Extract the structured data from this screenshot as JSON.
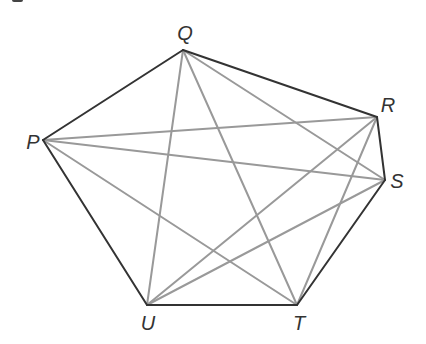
{
  "diagram": {
    "title": "",
    "type": "complete graph on pentagon-like hexagon vertices",
    "colors": {
      "outline": "#333333",
      "diagonal": "#999999",
      "label": "#333333",
      "background": "#ffffff"
    },
    "vertices": [
      {
        "id": "Q",
        "label": "Q",
        "x": 183,
        "y": 50,
        "label_x": 185,
        "label_y": 40
      },
      {
        "id": "R",
        "label": "R",
        "x": 377,
        "y": 117,
        "label_x": 388,
        "label_y": 112
      },
      {
        "id": "S",
        "label": "S",
        "x": 385,
        "y": 180,
        "label_x": 397,
        "label_y": 188
      },
      {
        "id": "T",
        "label": "T",
        "x": 297,
        "y": 305,
        "label_x": 299,
        "label_y": 330
      },
      {
        "id": "U",
        "label": "U",
        "x": 147,
        "y": 305,
        "label_x": 148,
        "label_y": 330
      },
      {
        "id": "P",
        "label": "P",
        "x": 43,
        "y": 140,
        "label_x": 33,
        "label_y": 149
      }
    ],
    "outline_edges": [
      [
        "P",
        "Q"
      ],
      [
        "Q",
        "R"
      ],
      [
        "R",
        "S"
      ],
      [
        "S",
        "T"
      ],
      [
        "T",
        "U"
      ],
      [
        "U",
        "P"
      ]
    ],
    "diagonal_edges": [
      [
        "Q",
        "U"
      ],
      [
        "Q",
        "T"
      ],
      [
        "Q",
        "S"
      ],
      [
        "P",
        "R"
      ],
      [
        "P",
        "S"
      ],
      [
        "P",
        "T"
      ],
      [
        "R",
        "U"
      ],
      [
        "R",
        "T"
      ],
      [
        "S",
        "U"
      ]
    ]
  }
}
